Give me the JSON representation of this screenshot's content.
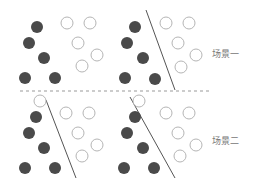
{
  "colors": {
    "filled": "#4a4a4a",
    "open_stroke": "#b5b5b5",
    "line": "#555555",
    "dash": "#999999"
  },
  "radius": 6,
  "divider": {
    "x1": 20,
    "x2": 212,
    "y": 91
  },
  "labels": [
    {
      "id": "scene-1",
      "text": "场景一",
      "x": 212,
      "y": 47
    },
    {
      "id": "scene-2",
      "text": "场景二",
      "x": 212,
      "y": 134
    }
  ],
  "panels": [
    {
      "name": "top-left",
      "filled": [
        [
          37,
          27
        ],
        [
          29,
          43
        ],
        [
          44,
          58
        ],
        [
          25,
          78
        ],
        [
          55,
          78
        ]
      ],
      "open": [
        [
          67,
          23
        ],
        [
          90,
          23
        ],
        [
          78,
          43
        ],
        [
          97,
          55
        ],
        [
          82,
          66
        ]
      ],
      "line": null
    },
    {
      "name": "top-right",
      "filled": [
        [
          135,
          27
        ],
        [
          127,
          43
        ],
        [
          143,
          58
        ],
        [
          125,
          78
        ],
        [
          155,
          79
        ]
      ],
      "open": [
        [
          166,
          23
        ],
        [
          189,
          23
        ],
        [
          178,
          43
        ],
        [
          196,
          55
        ],
        [
          181,
          67
        ]
      ],
      "line": [
        146,
        10,
        175,
        90
      ]
    },
    {
      "name": "bottom-left",
      "filled": [
        [
          36,
          117
        ],
        [
          29,
          133
        ],
        [
          44,
          148
        ],
        [
          25,
          168
        ],
        [
          55,
          168
        ]
      ],
      "open": [
        [
          40,
          101
        ],
        [
          66,
          113
        ],
        [
          89,
          113
        ],
        [
          78,
          133
        ],
        [
          97,
          145
        ],
        [
          82,
          156
        ]
      ],
      "line": [
        46,
        100,
        76,
        178
      ]
    },
    {
      "name": "bottom-right",
      "filled": [
        [
          135,
          117
        ],
        [
          127,
          133
        ],
        [
          143,
          148
        ],
        [
          124,
          168
        ],
        [
          154,
          168
        ]
      ],
      "open": [
        [
          139,
          101
        ],
        [
          166,
          113
        ],
        [
          189,
          113
        ],
        [
          178,
          133
        ],
        [
          196,
          145
        ],
        [
          180,
          156
        ]
      ],
      "line": [
        130,
        97,
        175,
        178
      ]
    }
  ]
}
